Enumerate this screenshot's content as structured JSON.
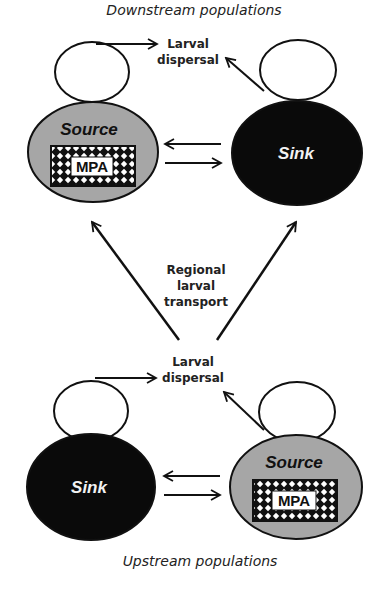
{
  "diagram": {
    "title_top": "Downstream populations",
    "title_bottom": "Upstream populations",
    "colors": {
      "source_fill": "#a6a6a6",
      "sink_fill": "#0a0a0a",
      "stroke": "#111111",
      "background": "#ffffff"
    },
    "top": {
      "left_node": {
        "label": "Source",
        "type": "source",
        "inner_label": "MPA"
      },
      "right_node": {
        "label": "Sink",
        "type": "sink"
      },
      "dispersal_label_line1": "Larval",
      "dispersal_label_line2": "dispersal"
    },
    "middle": {
      "transport_line1": "Regional",
      "transport_line2": "larval",
      "transport_line3": "transport"
    },
    "bottom": {
      "left_node": {
        "label": "Sink",
        "type": "sink"
      },
      "right_node": {
        "label": "Source",
        "type": "source",
        "inner_label": "MPA"
      },
      "dispersal_label_line1": "Larval",
      "dispersal_label_line2": "dispersal"
    },
    "edges": [
      {
        "from": "top.source",
        "to": "top.sink",
        "label": ""
      },
      {
        "from": "top.sink",
        "to": "top.source",
        "label": ""
      },
      {
        "from": "bottom.sink",
        "to": "bottom.source",
        "label": ""
      },
      {
        "from": "bottom.source",
        "to": "bottom.sink",
        "label": ""
      },
      {
        "from": "bottom",
        "to": "top.source",
        "label": "Regional larval transport"
      },
      {
        "from": "bottom",
        "to": "top.sink",
        "label": "Regional larval transport"
      }
    ]
  }
}
